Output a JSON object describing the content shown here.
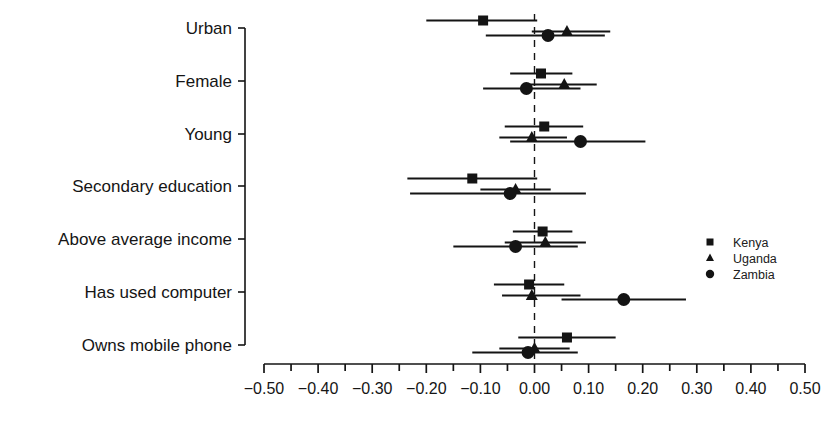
{
  "chart_data": {
    "type": "scatter",
    "orientation": "horizontal",
    "title": "",
    "subtitle": "",
    "xlabel": "",
    "ylabel": "",
    "xlim": [
      -0.5,
      0.5
    ],
    "xticks": [
      -0.5,
      -0.4,
      -0.3,
      -0.2,
      -0.1,
      0.0,
      0.1,
      0.2,
      0.3,
      0.4,
      0.5
    ],
    "xticklabels": [
      "-0.50",
      "-0.40",
      "-0.30",
      "-0.20",
      "-0.10",
      "0.00",
      "0.10",
      "0.20",
      "0.30",
      "0.40",
      "0.50"
    ],
    "minor_tick_step": 0.05,
    "grid": false,
    "reference_line": {
      "value": 0.0,
      "style": "dashed"
    },
    "categories": [
      "Urban",
      "Female",
      "Young",
      "Secondary education",
      "Above average income",
      "Has used computer",
      "Owns mobile phone"
    ],
    "legend": {
      "position": "right",
      "entries": [
        {
          "name": "Kenya",
          "marker": "square"
        },
        {
          "name": "Uganda",
          "marker": "triangle"
        },
        {
          "name": "Zambia",
          "marker": "circle"
        }
      ]
    },
    "series": [
      {
        "name": "Kenya",
        "marker": "square",
        "estimates": [
          -0.095,
          0.012,
          0.018,
          -0.115,
          0.015,
          -0.01,
          0.06
        ],
        "ci_low": [
          -0.2,
          -0.045,
          -0.055,
          -0.235,
          -0.04,
          -0.075,
          -0.03
        ],
        "ci_high": [
          0.005,
          0.07,
          0.09,
          0.005,
          0.07,
          0.055,
          0.15
        ]
      },
      {
        "name": "Uganda",
        "marker": "triangle",
        "estimates": [
          0.06,
          0.055,
          -0.005,
          -0.035,
          0.02,
          -0.005,
          0.0
        ],
        "ci_low": [
          -0.005,
          -0.01,
          -0.065,
          -0.1,
          -0.055,
          -0.06,
          -0.065
        ],
        "ci_high": [
          0.14,
          0.115,
          0.06,
          0.03,
          0.095,
          0.085,
          0.065
        ]
      },
      {
        "name": "Zambia",
        "marker": "circle",
        "estimates": [
          0.025,
          -0.015,
          0.085,
          -0.045,
          -0.035,
          0.165,
          -0.012
        ],
        "ci_low": [
          -0.09,
          -0.095,
          -0.045,
          -0.23,
          -0.15,
          0.05,
          -0.115
        ],
        "ci_high": [
          0.13,
          0.085,
          0.205,
          0.095,
          0.08,
          0.28,
          0.08
        ]
      }
    ]
  },
  "axis": {
    "y_categories_label": "Characteristic",
    "x_axis_name": "coefficient-axis"
  }
}
